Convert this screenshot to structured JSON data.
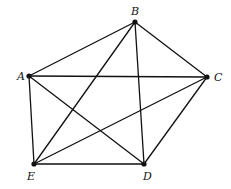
{
  "diagram": {
    "type": "complete-graph",
    "name": "K5",
    "vertices": [
      {
        "id": "A",
        "label": "A",
        "x": 29,
        "y": 76,
        "lx": 17,
        "ly": 80
      },
      {
        "id": "B",
        "label": "B",
        "x": 135,
        "y": 22,
        "lx": 131,
        "ly": 15
      },
      {
        "id": "C",
        "label": "C",
        "x": 207,
        "y": 77,
        "lx": 214,
        "ly": 81
      },
      {
        "id": "D",
        "label": "D",
        "x": 144,
        "y": 164,
        "lx": 143,
        "ly": 180
      },
      {
        "id": "E",
        "label": "E",
        "x": 34,
        "y": 164,
        "lx": 27,
        "ly": 180
      }
    ],
    "edges": [
      [
        "A",
        "B"
      ],
      [
        "A",
        "C"
      ],
      [
        "A",
        "D"
      ],
      [
        "A",
        "E"
      ],
      [
        "B",
        "C"
      ],
      [
        "B",
        "D"
      ],
      [
        "B",
        "E"
      ],
      [
        "C",
        "D"
      ],
      [
        "C",
        "E"
      ],
      [
        "D",
        "E"
      ]
    ],
    "colors": {
      "stroke": "#111111",
      "background": "#ffffff"
    }
  }
}
